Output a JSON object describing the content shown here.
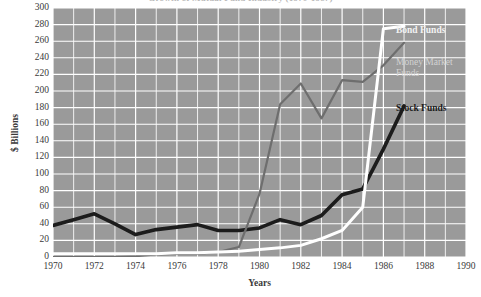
{
  "chart_data": {
    "type": "line",
    "title": "Growth of Mutual Fund Industry (1970-1987)",
    "xlabel": "Years",
    "ylabel": "$ Billions",
    "xlim": [
      1970,
      1990
    ],
    "ylim": [
      0,
      300
    ],
    "grid": true,
    "legend_position": "inline-right",
    "x_ticks": [
      1970,
      1972,
      1974,
      1976,
      1978,
      1980,
      1982,
      1984,
      1986,
      1988,
      1990
    ],
    "y_ticks": [
      0,
      20,
      40,
      60,
      80,
      100,
      120,
      140,
      160,
      180,
      200,
      220,
      240,
      260,
      280,
      300
    ],
    "x": [
      1970,
      1971,
      1972,
      1973,
      1974,
      1975,
      1976,
      1977,
      1978,
      1979,
      1980,
      1981,
      1982,
      1983,
      1984,
      1985,
      1986,
      1987
    ],
    "series": [
      {
        "name": "Stock Funds",
        "color": "#1c1c1c",
        "values": [
          38,
          45,
          52,
          40,
          27,
          33,
          36,
          39,
          32,
          32,
          35,
          45,
          39,
          50,
          75,
          82,
          130,
          182
        ]
      },
      {
        "name": "Money Market Funds",
        "color": "#6e6e6e",
        "values": [
          0,
          0,
          0,
          0,
          1,
          3,
          4,
          4,
          6,
          12,
          76,
          184,
          209,
          167,
          213,
          211,
          231,
          258
        ]
      },
      {
        "name": "Bond Funds",
        "color": "#ffffff",
        "values": [
          4,
          4,
          4,
          4,
          4,
          4,
          5,
          5,
          6,
          7,
          9,
          11,
          14,
          22,
          32,
          60,
          275,
          278
        ]
      }
    ],
    "colors": {
      "plot_background": "#9a9a9a",
      "gridlines": "#ffffff",
      "page_background": "#ffffff",
      "axis_text": "#3a3a3a"
    }
  }
}
